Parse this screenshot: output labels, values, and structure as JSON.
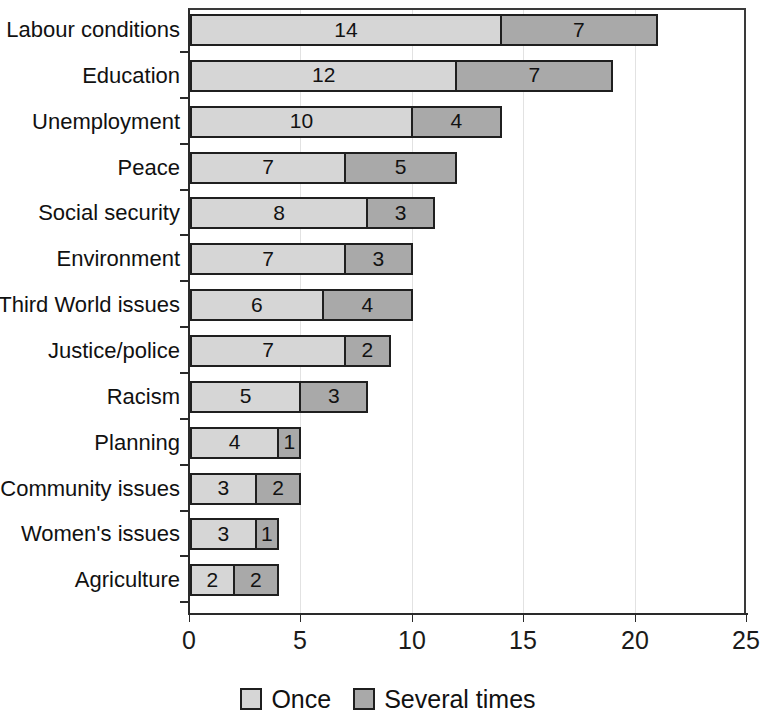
{
  "chart_data": {
    "type": "bar",
    "orientation": "horizontal",
    "stacked": true,
    "title": "",
    "subtitle": "",
    "xlabel": "",
    "ylabel": "",
    "xlim": [
      0,
      25
    ],
    "xticks": [
      0,
      5,
      10,
      15,
      20,
      25
    ],
    "xtick_labels": [
      "0",
      "5",
      "10",
      "15",
      "20",
      "25"
    ],
    "grid": "vertical-light",
    "legend_position": "bottom-center",
    "categories": [
      "Labour conditions",
      "Education",
      "Unemployment",
      "Peace",
      "Social security",
      "Environment",
      "Third World issues",
      "Justice/police",
      "Racism",
      "Planning",
      "Community issues",
      "Women's issues",
      "Agriculture"
    ],
    "series": [
      {
        "name": "Once",
        "color": "#d6d6d6",
        "values": [
          14,
          12,
          10,
          7,
          8,
          7,
          6,
          7,
          5,
          4,
          3,
          3,
          2
        ]
      },
      {
        "name": "Several times",
        "color": "#a9a9a9",
        "values": [
          7,
          7,
          4,
          5,
          3,
          3,
          4,
          2,
          3,
          1,
          2,
          1,
          2
        ]
      }
    ],
    "totals": [
      21,
      19,
      14,
      12,
      11,
      10,
      10,
      9,
      8,
      5,
      5,
      4,
      4
    ],
    "bar_labels_shown": true
  },
  "legend": {
    "items": [
      {
        "label": "Once",
        "swatch": "once"
      },
      {
        "label": "Several times",
        "swatch": "several"
      }
    ]
  },
  "colors": {
    "once": "#d6d6d6",
    "several": "#a9a9a9",
    "axis": "#2a2a2a",
    "grid": "#e2e2e2",
    "text": "#111111",
    "background": "#ffffff"
  }
}
